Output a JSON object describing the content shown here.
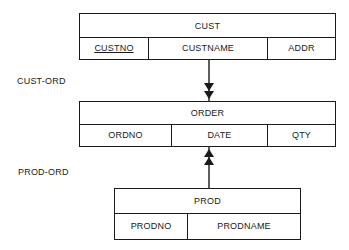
{
  "diagram": {
    "type": "network-data-model",
    "records": [
      {
        "name": "CUST",
        "fields": [
          {
            "label": "CUSTNO",
            "key": true
          },
          {
            "label": "CUSTNAME",
            "key": false
          },
          {
            "label": "ADDR",
            "key": false
          }
        ]
      },
      {
        "name": "ORDER",
        "fields": [
          {
            "label": "ORDNO",
            "key": false
          },
          {
            "label": "DATE",
            "key": false
          },
          {
            "label": "QTY",
            "key": false
          }
        ]
      },
      {
        "name": "PROD",
        "fields": [
          {
            "label": "PRODNO",
            "key": false
          },
          {
            "label": "PRODNAME",
            "key": false
          }
        ]
      }
    ],
    "sets": [
      {
        "label": "CUST-ORD",
        "owner": "CUST",
        "member": "ORDER",
        "arrow": "double-head"
      },
      {
        "label": "PROD-ORD",
        "owner": "PROD",
        "member": "ORDER",
        "arrow": "double-head"
      }
    ],
    "colors": {
      "line": "#1a1a1a",
      "background": "#ffffff"
    }
  }
}
